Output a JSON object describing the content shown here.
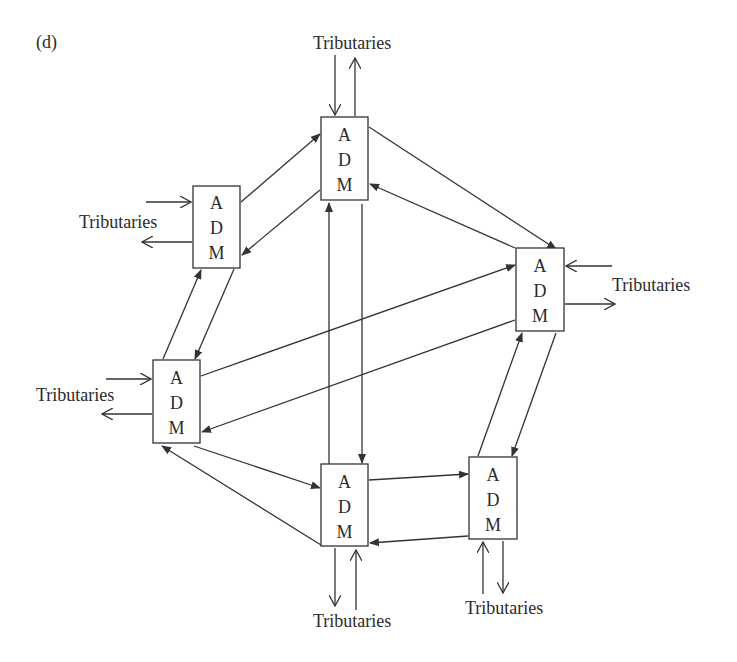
{
  "figure_label": "(d)",
  "node_label": {
    "line1": "A",
    "line2": "D",
    "line3": "M"
  },
  "nodes": [
    {
      "id": "top",
      "label": "ADM",
      "tributaries": "Tributaries"
    },
    {
      "id": "upper-left",
      "label": "ADM",
      "tributaries": "Tributaries"
    },
    {
      "id": "right",
      "label": "ADM",
      "tributaries": "Tributaries"
    },
    {
      "id": "left",
      "label": "ADM",
      "tributaries": "Tributaries"
    },
    {
      "id": "bottom-center",
      "label": "ADM",
      "tributaries": "Tributaries"
    },
    {
      "id": "bottom-right",
      "label": "ADM",
      "tributaries": "Tributaries"
    }
  ],
  "colors": {
    "stroke": "#333333",
    "text": "#2b2b2b",
    "background": "#ffffff"
  }
}
